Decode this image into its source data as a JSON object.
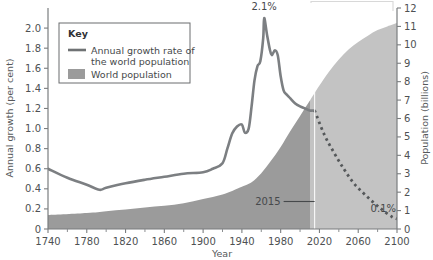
{
  "chart_data": {
    "type": "area",
    "title": "",
    "xlabel": "Year",
    "ylabel": "Annual growth (per cent)",
    "ylabel_right": "Population (billions)",
    "xlim": [
      1740,
      2100
    ],
    "ylim": [
      0,
      2.2
    ],
    "ylim_right": [
      0,
      12
    ],
    "grid": false,
    "legend_position": "upper-left",
    "x_ticks": [
      "1740",
      "1780",
      "1820",
      "1860",
      "1900",
      "1940",
      "1980",
      "2020",
      "2060",
      "2100"
    ],
    "x_tick_values": [
      1740,
      1780,
      1820,
      1860,
      1900,
      1940,
      1980,
      2020,
      2060,
      2100
    ],
    "x_minor_ticks": [
      1760,
      1800,
      1840,
      1880,
      1920,
      1960,
      2000,
      2040,
      2080
    ],
    "y_ticks_left": [
      "0",
      "0.2",
      "0.4",
      "0.6",
      "0.8",
      "1.0",
      "1.2",
      "1.4",
      "1.6",
      "1.8",
      "2.0"
    ],
    "y_tick_values_left": [
      0,
      0.2,
      0.4,
      0.6,
      0.8,
      1.0,
      1.2,
      1.4,
      1.6,
      1.8,
      2.0
    ],
    "y_ticks_right": [
      "0",
      "1",
      "2",
      "3",
      "4",
      "5",
      "6",
      "7",
      "8",
      "9",
      "10",
      "11",
      "12"
    ],
    "y_tick_values_right": [
      0,
      1,
      2,
      3,
      4,
      5,
      6,
      7,
      8,
      9,
      10,
      11,
      12
    ],
    "series": [
      {
        "name": "Annual growth rate of the world population",
        "type": "line",
        "axis": "left",
        "style": "solid",
        "color": "#7c7f82",
        "points": [
          [
            1740,
            0.6
          ],
          [
            1760,
            0.51
          ],
          [
            1780,
            0.44
          ],
          [
            1793,
            0.39
          ],
          [
            1800,
            0.41
          ],
          [
            1820,
            0.455
          ],
          [
            1840,
            0.49
          ],
          [
            1860,
            0.52
          ],
          [
            1880,
            0.55
          ],
          [
            1900,
            0.565
          ],
          [
            1910,
            0.6
          ],
          [
            1920,
            0.655
          ],
          [
            1925,
            0.8
          ],
          [
            1930,
            0.95
          ],
          [
            1935,
            1.02
          ],
          [
            1940,
            1.04
          ],
          [
            1943,
            0.96
          ],
          [
            1947,
            1.0
          ],
          [
            1950,
            1.22
          ],
          [
            1953,
            1.48
          ],
          [
            1956,
            1.62
          ],
          [
            1959,
            1.67
          ],
          [
            1962,
            1.9
          ],
          [
            1963,
            2.1
          ],
          [
            1966,
            1.93
          ],
          [
            1969,
            1.78
          ],
          [
            1971,
            1.73
          ],
          [
            1974,
            1.78
          ],
          [
            1977,
            1.73
          ],
          [
            1980,
            1.52
          ],
          [
            1983,
            1.38
          ],
          [
            1986,
            1.34
          ],
          [
            1990,
            1.3
          ],
          [
            1995,
            1.25
          ],
          [
            2000,
            1.22
          ],
          [
            2005,
            1.2
          ],
          [
            2010,
            1.18
          ],
          [
            2015,
            1.18
          ]
        ]
      },
      {
        "name": "Annual growth rate projection",
        "type": "line",
        "axis": "left",
        "style": "dashed",
        "color": "#55585a",
        "points": [
          [
            2015,
            1.18
          ],
          [
            2025,
            0.94
          ],
          [
            2035,
            0.76
          ],
          [
            2045,
            0.6
          ],
          [
            2055,
            0.46
          ],
          [
            2065,
            0.36
          ],
          [
            2075,
            0.27
          ],
          [
            2085,
            0.19
          ],
          [
            2095,
            0.12
          ],
          [
            2100,
            0.1
          ]
        ]
      },
      {
        "name": "World population",
        "type": "area",
        "axis": "right",
        "color": "#9b9b9b",
        "color_projection": "#c3c3c3",
        "points": [
          [
            1740,
            0.76
          ],
          [
            1780,
            0.87
          ],
          [
            1800,
            0.97
          ],
          [
            1820,
            1.06
          ],
          [
            1840,
            1.17
          ],
          [
            1860,
            1.26
          ],
          [
            1880,
            1.4
          ],
          [
            1900,
            1.63
          ],
          [
            1920,
            1.87
          ],
          [
            1940,
            2.3
          ],
          [
            1950,
            2.54
          ],
          [
            1960,
            3.03
          ],
          [
            1970,
            3.7
          ],
          [
            1980,
            4.45
          ],
          [
            1990,
            5.32
          ],
          [
            2000,
            6.14
          ],
          [
            2010,
            6.96
          ],
          [
            2015,
            7.38
          ],
          [
            2020,
            7.79
          ],
          [
            2030,
            8.55
          ],
          [
            2040,
            9.2
          ],
          [
            2050,
            9.74
          ],
          [
            2060,
            10.15
          ],
          [
            2070,
            10.5
          ],
          [
            2080,
            10.8
          ],
          [
            2090,
            11.0
          ],
          [
            2100,
            11.18
          ]
        ]
      }
    ],
    "annotations": [
      {
        "name": "peak-growth",
        "label": "2.1%",
        "x": 1963,
        "y": 2.1
      },
      {
        "name": "final-growth",
        "label": "0.1%",
        "x": 2090,
        "y": 0.1
      },
      {
        "name": "divider-year",
        "label": "2015",
        "x": 2015
      }
    ]
  },
  "legend": {
    "title": "Key",
    "items": [
      {
        "label_line1": "Annual growth rate of",
        "label_line2": "the world population",
        "swatch": "line",
        "color": "#6f7274"
      },
      {
        "label_line1": "World population",
        "label_line2": "",
        "swatch": "box",
        "color": "#9b9b9b"
      }
    ]
  },
  "axes": {
    "x_title": "Year",
    "y_left_title": "Annual growth (per cent)",
    "y_right_title": "Population (billions)"
  }
}
